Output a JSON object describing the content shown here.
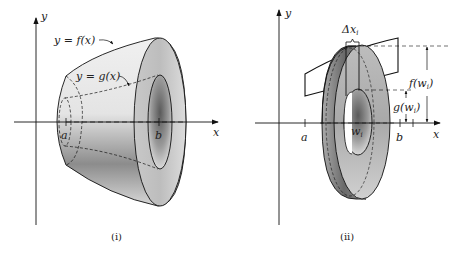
{
  "figure": {
    "panels": [
      {
        "id": "i",
        "caption": "(i)",
        "axes": {
          "x_label": "x",
          "y_label": "y"
        },
        "curve_labels": {
          "outer": "y = f(x)",
          "inner": "y = g(x)"
        },
        "tick_labels": {
          "a": "a",
          "b": "b"
        }
      },
      {
        "id": "ii",
        "caption": "(ii)",
        "axes": {
          "x_label": "x",
          "y_label": "y"
        },
        "slice_width_label": "Δx",
        "slice_width_sub": "i",
        "outer_radius_label": "f(w",
        "outer_radius_sub": "i",
        "inner_radius_label": "g(w",
        "inner_radius_sub": "i",
        "paren_close": ")",
        "tick_labels": {
          "a": "a",
          "w": "w",
          "w_sub": "i",
          "b": "b"
        }
      }
    ]
  }
}
